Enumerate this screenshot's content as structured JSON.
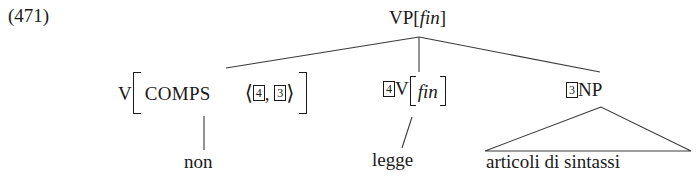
{
  "figure": {
    "example_number": "(471)",
    "language": "Italian",
    "type": "hpsg-syntax-tree"
  },
  "tree": {
    "root": {
      "id": "vp-fin",
      "category": "VP",
      "feature_open": "[",
      "feature": "fin",
      "feature_close": "]",
      "label_plain": "VP[fin]"
    },
    "children": [
      {
        "id": "v-comps",
        "category": "V",
        "avm": {
          "attribute": "COMPS",
          "value_open": "⟨",
          "value_close": "⟩",
          "value_tags": [
            "4",
            "3"
          ],
          "value_separator": ",",
          "value_plain": "⟨ 4 , 3 ⟩"
        },
        "label_plain": "V[COMPS ⟨ 4 , 3 ⟩]",
        "leaf": "non",
        "edge_style": "vertical"
      },
      {
        "id": "v-fin",
        "tag": "4",
        "category": "V",
        "feature_open": "[",
        "feature": "fin",
        "feature_close": "]",
        "label_plain": "4 V[fin]",
        "leaf": "legge",
        "edge_style": "slanted"
      },
      {
        "id": "np",
        "tag": "3",
        "category": "NP",
        "label_plain": "3 NP",
        "leaf": "articoli di sintassi",
        "edge_style": "triangle"
      }
    ]
  },
  "colors": {
    "ink": "#1a1a1a",
    "paper": "#ffffff",
    "rule": "#3a3a3a"
  }
}
